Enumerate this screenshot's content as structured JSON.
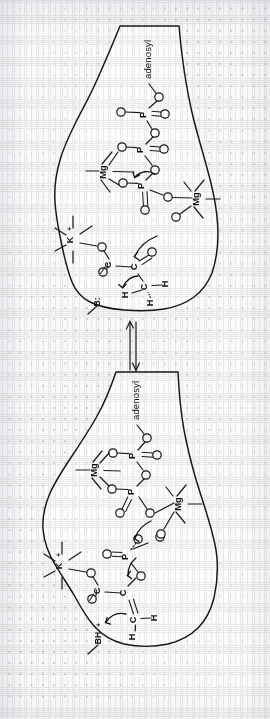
{
  "figure": {
    "kind": "chemical-reaction-mechanism",
    "orientation": "rotated-90-clockwise",
    "background": "dotted-graph-paper",
    "panel_count": 2,
    "ink_color": "#17171b",
    "paper_color": "#fefefe",
    "dot_color": "#8d8d93"
  },
  "labels": {
    "adenosyl": "adenosyl",
    "phosphorus": "P",
    "oxygen": "O",
    "carbon": "C",
    "hydrogen": "H",
    "magnesium": "Mg",
    "potassium": "K",
    "base_free": "B:",
    "base_protonated": "BH",
    "charge_plus": "+"
  },
  "panels": [
    {
      "id": "upper-panel",
      "name": "reactant-complex",
      "species": [
        "adenosyl",
        "P",
        "O",
        "Mg",
        "K",
        "C",
        "H",
        "B:"
      ],
      "atom_labels": {
        "adenosyl": "adenosyl",
        "p_gamma": "P",
        "p_beta": "P",
        "p_alpha": "P",
        "mg_left": "Mg",
        "mg_right": "Mg",
        "potassium": "K",
        "potassium_charge": "+",
        "carboxyl_carbon": "C",
        "keto_carbon": "C",
        "methyl_carbon": "C",
        "base": "B:",
        "hydrogens": [
          "H",
          "H",
          "H"
        ]
      },
      "arrow_count": 3
    },
    {
      "id": "lower-panel",
      "name": "product-complex",
      "species": [
        "adenosyl",
        "P",
        "O",
        "Mg",
        "K",
        "C",
        "H",
        "BH"
      ],
      "atom_labels": {
        "adenosyl": "adenosyl",
        "p_gamma": "P",
        "p_beta": "P",
        "p_alpha": "P",
        "mg_left": "Mg",
        "mg_right": "Mg",
        "potassium": "K",
        "potassium_charge": "+",
        "carboxyl_carbon": "C",
        "enol_carbon": "C",
        "methylene_carbon": "C",
        "base": "BH",
        "base_charge": "+",
        "hydrogens": [
          "H",
          "H"
        ]
      },
      "arrow_count": 3
    }
  ],
  "equilibrium": {
    "name": "equilibrium-arrows",
    "glyph": "⇌",
    "direction": "vertical",
    "arrow_count": 2
  }
}
